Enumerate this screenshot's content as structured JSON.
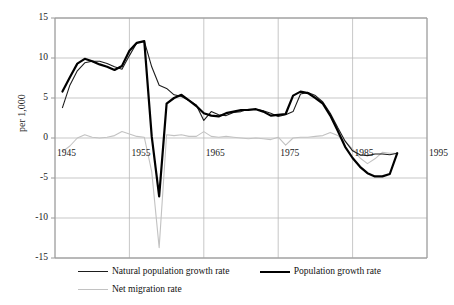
{
  "chart_data": {
    "type": "line",
    "title": "",
    "xlabel": "",
    "ylabel": "per 1,000",
    "xlim": [
      1945,
      1995
    ],
    "ylim": [
      -15,
      15
    ],
    "grid": true,
    "legend_position": "bottom",
    "xticks": [
      "1945",
      "1955",
      "1965",
      "1975",
      "1985",
      "1995"
    ],
    "xtick_values": [
      1945,
      1955,
      1965,
      1975,
      1985,
      1995
    ],
    "yticks": [
      "15",
      "10",
      "5",
      "0",
      "-5",
      "-10",
      "-15"
    ],
    "ytick_values": [
      15,
      10,
      5,
      0,
      -5,
      -10,
      -15
    ],
    "x": [
      1946,
      1947,
      1948,
      1949,
      1950,
      1951,
      1952,
      1953,
      1954,
      1955,
      1956,
      1957,
      1958,
      1959,
      1960,
      1961,
      1962,
      1963,
      1964,
      1965,
      1966,
      1967,
      1968,
      1969,
      1970,
      1971,
      1972,
      1973,
      1974,
      1975,
      1976,
      1977,
      1978,
      1979,
      1980,
      1981,
      1982,
      1983,
      1984,
      1985,
      1986,
      1987,
      1988,
      1989,
      1990,
      1991
    ],
    "series": [
      {
        "name": "Natural population growth rate",
        "color": "#1d1d1d",
        "width": 1.1,
        "values": [
          3.8,
          6.6,
          8.4,
          9.4,
          9.6,
          9.6,
          9.3,
          8.9,
          8.6,
          10.3,
          11.9,
          12.1,
          8.9,
          6.6,
          6.2,
          5.4,
          5.2,
          4.7,
          4.1,
          2.2,
          3.3,
          2.9,
          2.8,
          3.2,
          3.3,
          3.6,
          3.6,
          3.4,
          3.1,
          2.7,
          2.9,
          3.3,
          5.5,
          5.7,
          5.3,
          4.5,
          3.1,
          1.3,
          -0.4,
          -1.6,
          -2.1,
          -2.2,
          -2.0,
          -2.0,
          -2.1,
          -1.9
        ]
      },
      {
        "name": "Population growth rate",
        "color": "#000000",
        "width": 2.2,
        "values": [
          5.8,
          7.6,
          9.3,
          9.9,
          9.6,
          9.2,
          8.9,
          8.5,
          9.0,
          10.9,
          11.9,
          12.1,
          0.2,
          -7.3,
          4.3,
          5.0,
          5.4,
          4.7,
          4.0,
          3.1,
          2.8,
          2.7,
          3.1,
          3.3,
          3.5,
          3.5,
          3.6,
          3.3,
          2.8,
          2.9,
          3.0,
          5.3,
          5.8,
          5.6,
          5.0,
          4.3,
          2.8,
          0.9,
          -1.1,
          -2.5,
          -3.6,
          -4.4,
          -4.8,
          -4.8,
          -4.5,
          -1.9
        ]
      },
      {
        "name": "Net migration rate",
        "color": "#c2c2c2",
        "width": 1.1,
        "values": [
          -1.7,
          -1.0,
          0.0,
          0.4,
          0.1,
          0.0,
          0.1,
          0.3,
          0.8,
          0.5,
          0.2,
          0.1,
          -4.2,
          -13.7,
          0.4,
          0.3,
          0.4,
          0.2,
          0.2,
          0.8,
          0.2,
          0.1,
          0.2,
          0.1,
          0.0,
          -0.1,
          0.0,
          -0.1,
          -0.2,
          0.1,
          -0.9,
          0.0,
          0.1,
          0.1,
          0.2,
          0.3,
          0.7,
          0.3,
          -0.4,
          -1.4,
          -2.5,
          -3.2,
          -2.6,
          -1.8,
          -1.9,
          -1.9
        ]
      }
    ]
  },
  "legend": {
    "items": [
      {
        "label": "Natural population growth rate",
        "style": "thin"
      },
      {
        "label": "Population growth rate",
        "style": "thick"
      },
      {
        "label": "Net migration rate",
        "style": "light"
      }
    ]
  },
  "colors": {
    "natural": "#1d1d1d",
    "population": "#000000",
    "migration": "#c2c2c2",
    "grid": "#b9b9b9",
    "axis": "#9a9a9a",
    "text": "#1a1a1a"
  }
}
